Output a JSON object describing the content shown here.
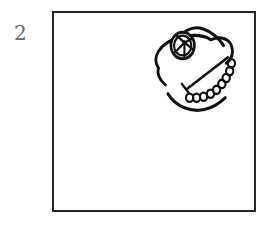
{
  "page": {
    "background_color": "#ffffff",
    "width": 273,
    "height": 225
  },
  "item_number": {
    "label": "2",
    "color": "#6b6b6b"
  },
  "drawing_frame": {
    "border_color": "#262626",
    "fill_color": "#ffffff",
    "border_width": 2,
    "x": 52,
    "y": 11,
    "width": 204,
    "height": 201
  },
  "sketch": {
    "name": "hand-drawn-creature-head",
    "description": "Hand-drawn ink sketch of a fish or creature head placed in the upper-right corner of the frame",
    "ink_color": "#111111",
    "strokes": [
      {
        "name": "head-outline-upper-left",
        "type": "path",
        "d": "M 120 56 C 112 44 122 32 140 26 C 156 21 172 22 180 27"
      },
      {
        "name": "head-outline-snout-left",
        "type": "path",
        "d": "M 120 56 C 118 62 122 68 128 73"
      },
      {
        "name": "head-outline-top-crest",
        "type": "path",
        "d": "M 142 27 C 150 18 160 14 170 16 C 180 18 188 24 194 32"
      },
      {
        "name": "head-outline-upper-right",
        "type": "path",
        "d": "M 180 27 C 190 24 200 26 203 33 C 206 40 203 46 197 50"
      },
      {
        "name": "mouth-smile-curve",
        "type": "path",
        "d": "M 131 82 C 140 94 156 100 172 98 C 182 96 190 91 196 85"
      },
      {
        "name": "diagonal-jaw-line",
        "type": "path",
        "d": "M 199 44 L 152 76"
      },
      {
        "name": "jaw-line-tick",
        "type": "path",
        "d": "M 148 72 L 154 80"
      },
      {
        "name": "beaded-chain",
        "type": "circle-chain",
        "circles": [
          {
            "cx": 203,
            "cy": 50,
            "r": 4
          },
          {
            "cx": 201,
            "cy": 58,
            "r": 4
          },
          {
            "cx": 198,
            "cy": 65,
            "r": 4
          },
          {
            "cx": 193,
            "cy": 71,
            "r": 4
          },
          {
            "cx": 187,
            "cy": 76,
            "r": 4
          },
          {
            "cx": 180,
            "cy": 80,
            "r": 4
          },
          {
            "cx": 172,
            "cy": 83,
            "r": 4
          },
          {
            "cx": 164,
            "cy": 84,
            "r": 4
          },
          {
            "cx": 156,
            "cy": 84,
            "r": 4
          }
        ]
      }
    ],
    "eye": {
      "name": "creature-eye",
      "outer_circle": {
        "cx": 148,
        "cy": 33,
        "r": 13
      },
      "inner_circle": {
        "cx": 148,
        "cy": 33,
        "r": 10
      },
      "pupil": {
        "cx": 150,
        "cy": 30,
        "r": 2
      },
      "radial_lines": [
        {
          "x1": 150,
          "y1": 30,
          "x2": 141,
          "y2": 24
        },
        {
          "x1": 150,
          "y1": 30,
          "x2": 158,
          "y2": 26
        },
        {
          "x1": 150,
          "y1": 30,
          "x2": 159,
          "y2": 37
        },
        {
          "x1": 150,
          "y1": 30,
          "x2": 150,
          "y2": 43
        },
        {
          "x1": 150,
          "y1": 30,
          "x2": 139,
          "y2": 40
        }
      ]
    }
  }
}
